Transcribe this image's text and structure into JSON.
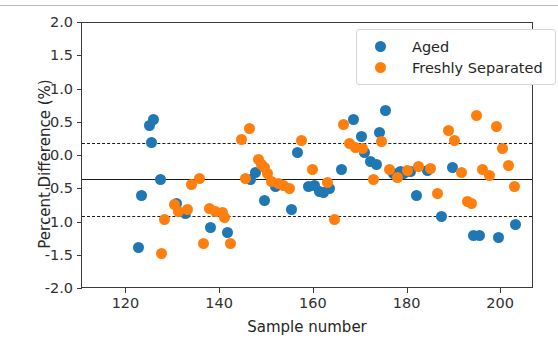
{
  "figure": {
    "background": "#ffffff",
    "page_rule_color": "#b9b9b9"
  },
  "legend": {
    "position": "upper-right",
    "entries": [
      {
        "label": "Aged",
        "color": "#1f77b4",
        "marker": "circle"
      },
      {
        "label": "Freshly Separated",
        "color": "#ff7f0e",
        "marker": "circle"
      }
    ]
  },
  "chart_data": {
    "type": "scatter",
    "title": "",
    "xlabel": "Sample number",
    "ylabel": "Percent Difference (%)",
    "xlim": [
      110.5,
      207.0
    ],
    "ylim": [
      -2.0,
      2.0
    ],
    "xticks": [
      120,
      140,
      160,
      180,
      200
    ],
    "xtick_labels": [
      "120",
      "140",
      "160",
      "180",
      "200"
    ],
    "yticks": [
      2.0,
      1.5,
      1.0,
      0.5,
      0.0,
      -0.5,
      -1.0,
      -1.5,
      -2.0
    ],
    "ytick_labels": [
      "2.0",
      "1.5",
      "1.0",
      "0.5",
      "0.0",
      "-0.5",
      "-1.0",
      "-1.5",
      "-2.0"
    ],
    "grid": false,
    "reference_lines": [
      {
        "name": "upper-limit-of-agreement",
        "y": 0.19,
        "style": "dashed",
        "color": "#1a1a1a"
      },
      {
        "name": "mean-bias",
        "y": -0.35,
        "style": "solid",
        "color": "#1a1a1a"
      },
      {
        "name": "lower-limit-of-agreement",
        "y": -0.9,
        "style": "dashed",
        "color": "#1a1a1a"
      }
    ],
    "series": [
      {
        "name": "Aged",
        "color": "#1f77b4",
        "points": [
          [
            122.6,
            -1.37
          ],
          [
            123.3,
            -0.59
          ],
          [
            125.0,
            0.46
          ],
          [
            125.3,
            0.21
          ],
          [
            125.8,
            0.55
          ],
          [
            127.3,
            -0.36
          ],
          [
            130.7,
            -0.71
          ],
          [
            132.6,
            -0.86
          ],
          [
            138.0,
            -1.07
          ],
          [
            141.6,
            -1.15
          ],
          [
            146.5,
            -0.36
          ],
          [
            147.6,
            -0.25
          ],
          [
            149.4,
            -0.67
          ],
          [
            151.8,
            -0.46
          ],
          [
            155.3,
            -0.81
          ],
          [
            156.5,
            0.05
          ],
          [
            158.9,
            -0.46
          ],
          [
            160.1,
            -0.45
          ],
          [
            161.2,
            -0.53
          ],
          [
            162.0,
            -0.55
          ],
          [
            163.4,
            -0.49
          ],
          [
            166.0,
            -0.21
          ],
          [
            168.4,
            0.55
          ],
          [
            170.1,
            0.3
          ],
          [
            170.9,
            0.05
          ],
          [
            172.2,
            -0.09
          ],
          [
            173.4,
            -0.13
          ],
          [
            174.0,
            0.35
          ],
          [
            175.3,
            0.68
          ],
          [
            177.0,
            -0.26
          ],
          [
            178.4,
            -0.24
          ],
          [
            179.2,
            -0.26
          ],
          [
            180.6,
            -0.24
          ],
          [
            181.9,
            -0.59
          ],
          [
            184.3,
            -0.22
          ],
          [
            187.2,
            -0.91
          ],
          [
            189.6,
            -0.18
          ],
          [
            194.1,
            -1.19
          ],
          [
            195.4,
            -1.2
          ],
          [
            199.5,
            -1.23
          ],
          [
            203.0,
            -1.03
          ]
        ]
      },
      {
        "name": "Freshly Separated",
        "color": "#ff7f0e",
        "points": [
          [
            127.5,
            -1.46
          ],
          [
            128.2,
            -0.95
          ],
          [
            130.2,
            -0.73
          ],
          [
            131.2,
            -0.83
          ],
          [
            133.0,
            -0.8
          ],
          [
            133.9,
            -0.43
          ],
          [
            135.6,
            -0.34
          ],
          [
            136.4,
            -1.31
          ],
          [
            137.8,
            -0.79
          ],
          [
            139.1,
            -0.84
          ],
          [
            140.5,
            -0.85
          ],
          [
            141.0,
            -0.92
          ],
          [
            142.1,
            -1.31
          ],
          [
            144.5,
            0.25
          ],
          [
            145.5,
            -0.34
          ],
          [
            146.2,
            0.42
          ],
          [
            148.1,
            -0.05
          ],
          [
            148.8,
            -0.13
          ],
          [
            149.5,
            -0.17
          ],
          [
            150.2,
            -0.26
          ],
          [
            151.0,
            -0.38
          ],
          [
            152.4,
            -0.42
          ],
          [
            153.5,
            -0.45
          ],
          [
            154.8,
            -0.49
          ],
          [
            157.3,
            0.24
          ],
          [
            159.7,
            -0.21
          ],
          [
            163.0,
            -0.4
          ],
          [
            164.5,
            -0.95
          ],
          [
            166.3,
            0.47
          ],
          [
            167.7,
            0.19
          ],
          [
            168.9,
            0.13
          ],
          [
            170.4,
            0.12
          ],
          [
            172.8,
            -0.35
          ],
          [
            174.5,
            0.22
          ],
          [
            176.1,
            -0.2
          ],
          [
            177.8,
            -0.33
          ],
          [
            180.0,
            -0.22
          ],
          [
            182.4,
            -0.16
          ],
          [
            185.0,
            -0.19
          ],
          [
            186.3,
            -0.56
          ],
          [
            188.7,
            0.39
          ],
          [
            190.1,
            0.23
          ],
          [
            191.5,
            -0.25
          ],
          [
            192.8,
            -0.69
          ],
          [
            193.6,
            -0.71
          ],
          [
            194.8,
            0.61
          ],
          [
            196.0,
            -0.21
          ],
          [
            197.5,
            -0.29
          ],
          [
            199.0,
            0.45
          ],
          [
            200.3,
            0.12
          ],
          [
            201.6,
            -0.14
          ],
          [
            202.8,
            -0.46
          ]
        ]
      }
    ]
  }
}
